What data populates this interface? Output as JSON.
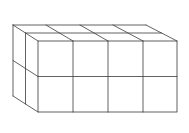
{
  "diagram": {
    "type": "isometric-cube-stack",
    "dimensions": {
      "width_cubes": 4,
      "height_cubes": 2,
      "depth_cubes": 2
    },
    "total_cubes": 16,
    "colors": {
      "line": "#3a3a3a",
      "background": "#ffffff"
    }
  }
}
